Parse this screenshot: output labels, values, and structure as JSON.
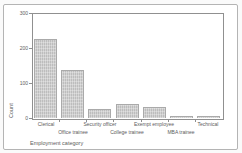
{
  "chart_data": {
    "type": "bar",
    "title": "",
    "categories": [
      "Clerical",
      "Office trainee",
      "Security officer",
      "College trainee",
      "Exempt employee",
      "MBA trainee",
      "Technical"
    ],
    "values": [
      227,
      136,
      27,
      41,
      32,
      5,
      6
    ],
    "xlabel": "Employment category",
    "ylabel": "Count",
    "ylim": [
      0,
      300
    ],
    "yticks": [
      0,
      100,
      200,
      300
    ],
    "ytick_labels": [
      "0",
      "100",
      "200",
      "300"
    ],
    "grid": false,
    "legend": false,
    "label_rows": "staggered",
    "colors": {
      "background": "#ffffff",
      "frame_border": "#b4b4b4",
      "axis": "#909090",
      "bar_fill": "#c7c7c7",
      "bar_border": "#aaaaaa",
      "text": "#5c5c5c"
    }
  }
}
